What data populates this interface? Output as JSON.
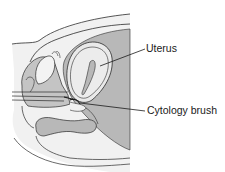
{
  "diagram": {
    "labels": {
      "uterus": "Uterus",
      "cytology_brush": "Cytology brush"
    },
    "colors": {
      "background": "#ffffff",
      "outline": "#2b2b2b",
      "dark_tissue": "#b5b5b5",
      "light_tissue": "#e4e4e4",
      "pale_tissue": "#f2f2f2"
    }
  }
}
